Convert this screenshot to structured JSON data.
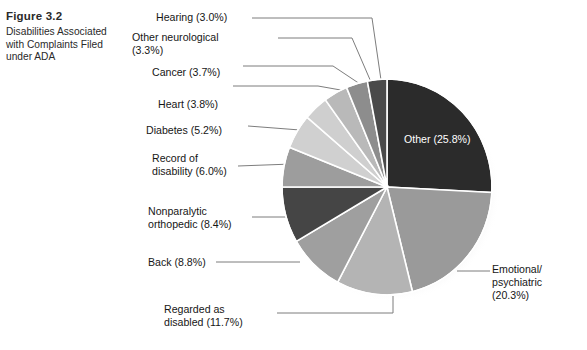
{
  "figure": {
    "number": "Figure 3.2",
    "caption": "Disabilities Associated with Complaints Filed under ADA"
  },
  "chart_data": {
    "type": "pie",
    "title": "Disabilities Associated with Complaints Filed under ADA",
    "unit": "percent",
    "legend_position": "callout-labels",
    "total_labeled": 99.8,
    "categories": [
      "Other",
      "Emotional/psychiatric",
      "Regarded as disabled",
      "Back",
      "Nonparalytic orthopedic",
      "Record of disability",
      "Diabetes",
      "Heart",
      "Cancer",
      "Other neurological",
      "Hearing"
    ],
    "values": [
      25.8,
      20.3,
      11.7,
      8.8,
      8.4,
      6.0,
      5.2,
      3.8,
      3.7,
      3.3,
      3.0
    ],
    "value_labels": [
      "25.8%",
      "20.3%",
      "11.7%",
      "8.8%",
      "8.4%",
      "6.0%",
      "5.2%",
      "3.8%",
      "3.7%",
      "3.3%",
      "3.0%"
    ],
    "slice_colors": [
      "#2b2b2b",
      "#9a9a9a",
      "#b4b4b4",
      "#9f9f9f",
      "#454545",
      "#9d9d9d",
      "#d0d0d0",
      "#cfcfcf",
      "#b9b9b9",
      "#8d8d8d",
      "#4a4a4a",
      "#6a6a6a"
    ]
  },
  "labels": {
    "hearing": "Hearing (3.0%)",
    "other_neurological": "Other neurological\n(3.3%)",
    "cancer": "Cancer (3.7%)",
    "heart": "Heart (3.8%)",
    "diabetes": "Diabetes (5.2%)",
    "record_of_disability": "Record of\ndisability (6.0%)",
    "nonparalytic_orthopedic": "Nonparalytic\northopedic (8.4%)",
    "back": "Back (8.8%)",
    "regarded_as_disabled": "Regarded as\ndisabled (11.7%)",
    "other": "Other (25.8%)",
    "emotional_psychiatric": "Emotional/\npsychiatric\n(20.3%)"
  },
  "colors": {
    "leader_line": "#7d7d7d",
    "slice_divider": "#ffffff",
    "pie_shadow": "#c9c9c9",
    "inner_label_text": "#ffffff",
    "text": "#161616"
  }
}
